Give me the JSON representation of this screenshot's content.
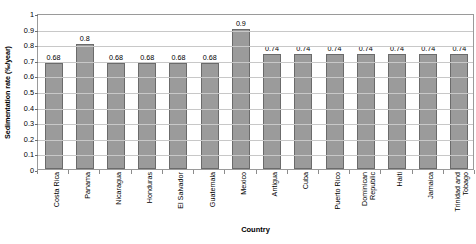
{
  "chart_data": {
    "type": "bar",
    "title": "",
    "xlabel": "Country",
    "ylabel": "Sedimentation rate (‰/year)",
    "ylim": [
      0,
      1
    ],
    "ytick_step": 0.1,
    "yticks": [
      "1",
      "0.9",
      "0.8",
      "0.7",
      "0.6",
      "0.5",
      "0.4",
      "0.3",
      "0.2",
      "0.1",
      "0"
    ],
    "grid": true,
    "legend": "none",
    "bar_color": "#9b9b9b",
    "bar_border_color": "#6b6b6b",
    "gridline_color": "#c8c8c8",
    "plot_border_color": "#9a9a9a",
    "categories": [
      "Costa Rica",
      "Panama",
      "Nicaragua",
      "Honduras",
      "El Salvador",
      "Guatemala",
      "Mexico",
      "Antigua",
      "Cuba",
      "Puerto Rico",
      "Dominican Republic",
      "Haiti",
      "Jamaica",
      "Trinidad and Tobago"
    ],
    "category_lines": [
      [
        "Costa Rica"
      ],
      [
        "Panama"
      ],
      [
        "Nicaragua"
      ],
      [
        "Honduras"
      ],
      [
        "El Salvador"
      ],
      [
        "Guatemala"
      ],
      [
        "Mexico"
      ],
      [
        "Antigua"
      ],
      [
        "Cuba"
      ],
      [
        "Puerto Rico"
      ],
      [
        "Dominican",
        "Republic"
      ],
      [
        "Haiti"
      ],
      [
        "Jamaica"
      ],
      [
        "Trinidad and",
        "Tobago"
      ]
    ],
    "values": [
      0.68,
      0.8,
      0.68,
      0.68,
      0.68,
      0.68,
      0.9,
      0.74,
      0.74,
      0.74,
      0.74,
      0.74,
      0.74,
      0.74
    ],
    "value_labels": [
      "0.68",
      "0.8",
      "0.68",
      "0.68",
      "0.68",
      "0.68",
      "0.9",
      "0.74",
      "0.74",
      "0.74",
      "0.74",
      "0.74",
      "0.74",
      "0.74"
    ]
  }
}
